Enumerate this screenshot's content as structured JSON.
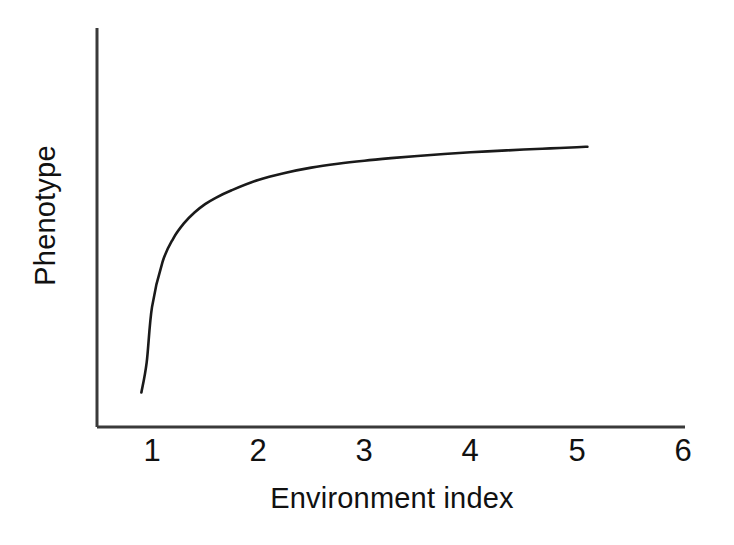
{
  "figure": {
    "background_color": "#ffffff",
    "line_color": "#1a1a1a",
    "axis_color": "#3a3a3a"
  },
  "axis": {
    "x_title": "Environment index",
    "y_title": "Phenotype"
  },
  "chart_data": {
    "type": "line",
    "title": "",
    "subtitle": "",
    "xlabel": "Environment index",
    "ylabel": "Phenotype",
    "xlim": [
      0.62,
      6.0
    ],
    "ylim": [
      0,
      1
    ],
    "xticks": [
      1,
      2,
      3,
      4,
      5,
      6
    ],
    "xtick_labels": [
      "1",
      "2",
      "3",
      "4",
      "5",
      "6"
    ],
    "yticks": [],
    "ytick_labels": [],
    "grid": false,
    "legend": null,
    "legend_position": "none",
    "annotations": [],
    "series": [
      {
        "name": "reaction norm",
        "style": "solid",
        "color": "#1a1a1a",
        "linewidth": 2,
        "x": [
          0.9,
          0.95,
          1.0,
          1.1,
          1.2,
          1.3,
          1.4,
          1.5,
          1.6,
          1.75,
          2.0,
          2.25,
          2.5,
          2.75,
          3.0,
          3.25,
          3.5,
          3.75,
          4.0,
          4.25,
          4.5,
          4.75,
          5.0,
          5.1
        ],
        "y": [
          0.077,
          0.185,
          0.383,
          0.546,
          0.629,
          0.683,
          0.722,
          0.752,
          0.775,
          0.802,
          0.839,
          0.864,
          0.883,
          0.897,
          0.908,
          0.917,
          0.925,
          0.932,
          0.938,
          0.943,
          0.948,
          0.952,
          0.956,
          0.958
        ]
      }
    ]
  }
}
